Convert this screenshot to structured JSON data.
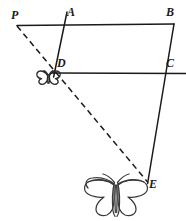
{
  "figure": {
    "type": "geometry-diagram",
    "width": 186,
    "height": 221,
    "background_color": "#ffffff",
    "stroke_color": "#1a1a1a",
    "label_color": "#1a1a1a",
    "labels": [
      {
        "text": "P",
        "x": 11,
        "y": 10
      },
      {
        "text": "A",
        "x": 68,
        "y": 7
      },
      {
        "text": "B",
        "x": 167,
        "y": 7
      },
      {
        "text": "D",
        "x": 57,
        "y": 57
      },
      {
        "text": "C",
        "x": 167,
        "y": 57
      },
      {
        "text": "E",
        "x": 149,
        "y": 178
      }
    ],
    "points": {
      "P": {
        "x": 17,
        "y": 25
      },
      "A": {
        "x": 66,
        "y": 17
      },
      "B": {
        "x": 174,
        "y": 24
      },
      "D": {
        "x": 55,
        "y": 72
      },
      "C": {
        "x": 164,
        "y": 73
      },
      "E": {
        "x": 148,
        "y": 182
      }
    },
    "solid_segments": [
      {
        "name": "line-PB",
        "x1": 17,
        "y1": 25,
        "x2": 174,
        "y2": 24
      },
      {
        "name": "line-AD",
        "x1": 67,
        "y1": 12,
        "x2": 54,
        "y2": 76
      },
      {
        "name": "line-DC",
        "x1": 51,
        "y1": 73,
        "x2": 186,
        "y2": 73
      },
      {
        "name": "line-BE",
        "x1": 174,
        "y1": 24,
        "x2": 148,
        "y2": 183
      }
    ],
    "dashed_segments": [
      {
        "name": "line-PE-dashed",
        "x1": 17,
        "y1": 26,
        "x2": 148,
        "y2": 182
      }
    ],
    "butterflies": [
      {
        "name": "butterfly-small-at-D",
        "cx": 48.5,
        "cy": 77,
        "scale": 0.2
      },
      {
        "name": "butterfly-large-at-E",
        "cx": 116,
        "cy": 197,
        "scale": 1.0
      }
    ]
  }
}
